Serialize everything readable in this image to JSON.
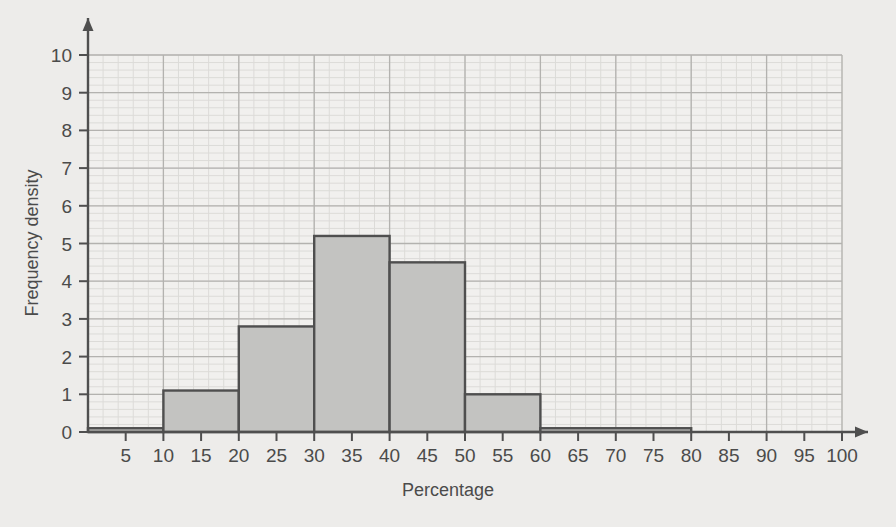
{
  "chart_data": {
    "type": "bar",
    "title": "",
    "xlabel": "Percentage",
    "ylabel": "Frequency density",
    "xlim": [
      0,
      100
    ],
    "ylim": [
      0,
      10
    ],
    "grid": true,
    "legend": "none",
    "x_ticks": [
      5,
      10,
      15,
      20,
      25,
      30,
      35,
      40,
      45,
      50,
      55,
      60,
      65,
      70,
      75,
      80,
      85,
      90,
      95,
      100
    ],
    "y_ticks": [
      0,
      1,
      2,
      3,
      4,
      5,
      6,
      7,
      8,
      9,
      10
    ],
    "x_tick_labels": [
      "5",
      "10",
      "15",
      "20",
      "25",
      "30",
      "35",
      "40",
      "45",
      "50",
      "55",
      "60",
      "65",
      "70",
      "75",
      "80",
      "85",
      "90",
      "95",
      "100"
    ],
    "y_tick_labels": [
      "0",
      "1",
      "2",
      "3",
      "4",
      "5",
      "6",
      "7",
      "8",
      "9",
      "10"
    ],
    "x_major_gridlines": [
      0,
      10,
      20,
      30,
      40,
      50,
      60,
      70,
      80,
      90,
      100
    ],
    "x_minor_step": 2,
    "y_minor_step": 0.2,
    "bin_edges": [
      0,
      10,
      20,
      30,
      40,
      50,
      60,
      80
    ],
    "categories": [
      "0-10",
      "10-20",
      "20-30",
      "30-40",
      "40-50",
      "50-60",
      "60-80"
    ],
    "values": [
      0.1,
      1.1,
      2.8,
      5.2,
      4.5,
      1.0,
      0.1
    ],
    "bars": [
      {
        "label": "0-10",
        "x0": 0,
        "x1": 10,
        "value": 0.1
      },
      {
        "label": "10-20",
        "x0": 10,
        "x1": 20,
        "value": 1.1
      },
      {
        "label": "20-30",
        "x0": 20,
        "x1": 30,
        "value": 2.8
      },
      {
        "label": "30-40",
        "x0": 30,
        "x1": 40,
        "value": 5.2
      },
      {
        "label": "40-50",
        "x0": 40,
        "x1": 50,
        "value": 4.5
      },
      {
        "label": "50-60",
        "x0": 50,
        "x1": 60,
        "value": 1.0
      },
      {
        "label": "60-80",
        "x0": 60,
        "x1": 80,
        "value": 0.1
      }
    ]
  },
  "style": {
    "page_background": "#edecea",
    "plot_background": "#f1f0ee",
    "bar_fill": "#c3c3c1",
    "bar_stroke": "#4f4f4f",
    "grid_major": "#b3b2af",
    "grid_minor": "#dcdbd8",
    "axis_color": "#4f4f4f",
    "text_color": "#4b4b4b"
  }
}
